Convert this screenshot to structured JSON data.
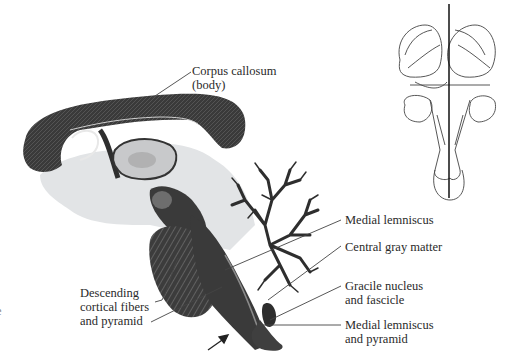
{
  "figure": {
    "type": "midsagittal brain section with orientation diagram",
    "colors": {
      "tissue_dark": "#2e2e2e",
      "tissue_mid": "#6a6a6a",
      "tissue_light": "#d6d8da",
      "outline": "#444444",
      "text": "#2a2a2a",
      "leader": "#444444"
    }
  },
  "labels": {
    "corpus_callosum": {
      "line1": "Corpus callosum",
      "line2": "(body)"
    },
    "medial_lemniscus": {
      "line1": "Medial lemniscus"
    },
    "central_gray_matter": {
      "line1": "Central gray matter"
    },
    "gracile": {
      "line1": "Gracile nucleus",
      "line2": "and fascicle"
    },
    "medial_lemniscus_pyramid": {
      "line1": "Medial lemniscus",
      "line2": "and pyramid"
    },
    "descending": {
      "line1": "Descending",
      "line2": "cortical fibers",
      "line3": "and pyramid"
    },
    "cut_off_left": {
      "line1": "e"
    }
  },
  "orientation_diagram": {
    "description": "dorsal view of brainstem with vertical midline section plane"
  },
  "arrow": {
    "direction": "up-right"
  }
}
